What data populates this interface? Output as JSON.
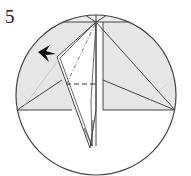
{
  "step": {
    "number": "5"
  },
  "diagram": {
    "colors": {
      "paper_shaded": "#e6e6e6",
      "paper_white": "#ffffff",
      "outline": "#444444",
      "arrow": "#111111",
      "faint_line": "#cfcfcf"
    },
    "elements": [
      "circle-frame",
      "shaded-paper-region",
      "kite-flap",
      "valley-fold-dashed-line",
      "mountain-fold-dash-dot-line",
      "push-arrow"
    ]
  }
}
